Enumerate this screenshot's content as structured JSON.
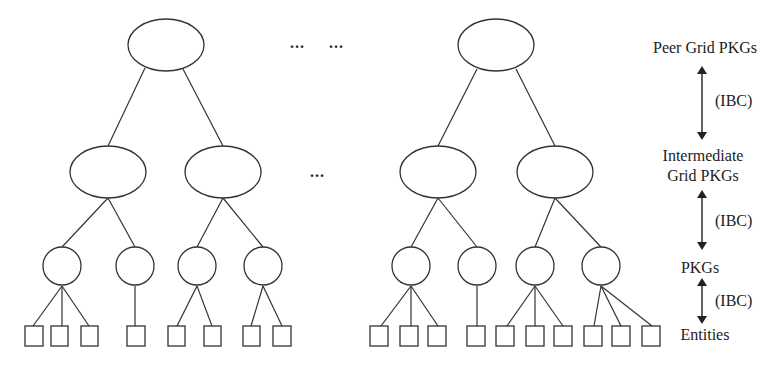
{
  "diagram": {
    "type": "hierarchical-tree",
    "ellipsis": "...",
    "levels": [
      {
        "label": "Peer Grid PKGs",
        "shape": "ellipse"
      },
      {
        "label_line1": "Intermediate",
        "label_line2": "Grid PKGs",
        "shape": "ellipse"
      },
      {
        "label": "PKGs",
        "shape": "circle"
      },
      {
        "label": "Entities",
        "shape": "square"
      }
    ],
    "connections": [
      {
        "label": "(IBC)",
        "between": [
          "Peer Grid PKGs",
          "Intermediate Grid PKGs"
        ]
      },
      {
        "label": "(IBC)",
        "between": [
          "Intermediate Grid PKGs",
          "PKGs"
        ]
      },
      {
        "label": "(IBC)",
        "between": [
          "PKGs",
          "Entities"
        ]
      }
    ],
    "trees": [
      {
        "name": "left-tree",
        "intermediate_count": 2,
        "pkg_children": [
          3,
          1,
          2,
          2
        ]
      },
      {
        "name": "right-tree",
        "intermediate_count": 2,
        "pkg_children": [
          3,
          1,
          3,
          3
        ]
      }
    ],
    "stroke_color": "#333333"
  }
}
